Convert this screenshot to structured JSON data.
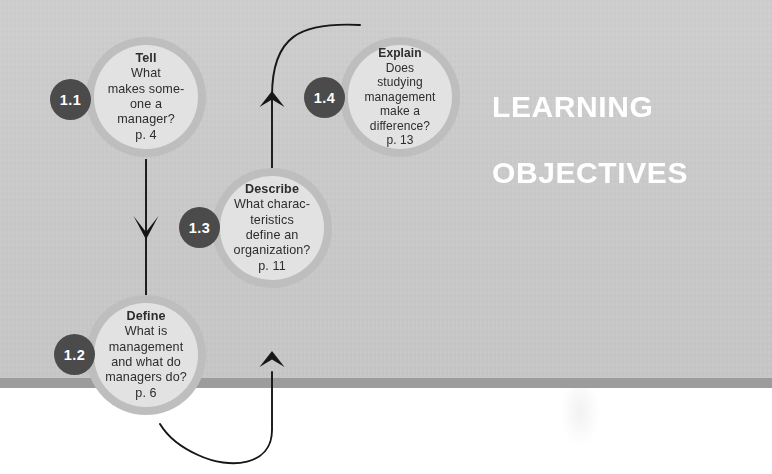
{
  "page": {
    "title_line1": "LEARNING",
    "title_line2": "OBJECTIVES",
    "background_color": "#c8c8c8",
    "band_color": "#9c9c9c",
    "footer_color": "#ffffff",
    "circle_fill": "#e2e2e2",
    "circle_ring": "#bebebe",
    "badge_color": "#4b4b4b",
    "text_color": "#2d2d2d",
    "title_color": "#ffffff",
    "connector_color": "#161616"
  },
  "objectives": [
    {
      "badge": "1.1",
      "verb": "Tell",
      "lines": [
        "What",
        "makes some-",
        "one a",
        "manager?"
      ],
      "page_ref": "p. 4"
    },
    {
      "badge": "1.2",
      "verb": "Define",
      "lines": [
        "What is",
        "management",
        "and what do",
        "managers do?"
      ],
      "page_ref": "p. 6"
    },
    {
      "badge": "1.3",
      "verb": "Describe",
      "lines": [
        "What charac-",
        "teristics",
        "define an",
        "organization?"
      ],
      "page_ref": "p. 11"
    },
    {
      "badge": "1.4",
      "verb": "Explain",
      "lines": [
        "Does",
        "studying",
        "management",
        "make a",
        "difference?"
      ],
      "page_ref": "p. 13"
    }
  ],
  "connectors": [
    {
      "name": "arrow-1-1-to-1-2",
      "from": "1.1",
      "to": "1.2",
      "shape": "straight-down"
    },
    {
      "name": "arrow-1-2-to-1-3",
      "from": "1.2",
      "to": "1.3",
      "shape": "curve-bottom-loop-up"
    },
    {
      "name": "arrow-1-3-to-1-4",
      "from": "1.3",
      "to": "1.4",
      "shape": "curve-top-loop-right"
    }
  ]
}
